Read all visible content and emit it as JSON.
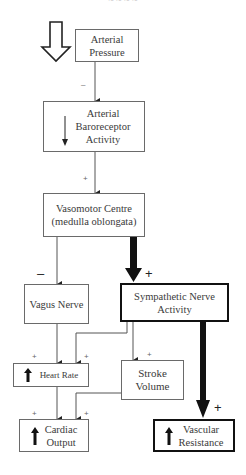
{
  "header": {
    "cutoff_text": "~ ~ ~ ~"
  },
  "nodes": {
    "arterial_pressure": {
      "label_line1": "Arterial",
      "label_line2": "Pressure"
    },
    "baroreceptor": {
      "label_line1": "Arterial",
      "label_line2": "Baroreceptor",
      "label_line3": "Activity",
      "indicator": "down-arrow"
    },
    "vasomotor": {
      "label_line1": "Vasomotor Centre",
      "label_line2": "(medulla oblongata)"
    },
    "vagus": {
      "label": "Vagus Nerve"
    },
    "sympathetic": {
      "label_line1": "Sympathetic Nerve",
      "label_line2": "Activity"
    },
    "heart_rate": {
      "label": "Heart Rate",
      "indicator": "up-arrow"
    },
    "stroke_volume": {
      "label_line1": "Stroke",
      "label_line2": "Volume"
    },
    "cardiac_output": {
      "label_line1": "Cardiac",
      "label_line2": "Output",
      "indicator": "up-arrow"
    },
    "vascular_resistance": {
      "label_line1": "Vascular",
      "label_line2": "Resistance",
      "indicator": "up-arrow"
    }
  },
  "signs": {
    "pressure_to_baro": "–",
    "baro_to_vasomotor": "+",
    "vasomotor_to_vagus": "–",
    "vasomotor_to_sympathetic": "+",
    "vagus_to_hr": "+",
    "symp_to_hr": "+",
    "symp_to_sv": "+",
    "hr_to_co": "+",
    "sv_to_co": "+",
    "symp_to_vr": "+"
  },
  "input_indicator": "hollow-down-arrow",
  "colors": {
    "line": "#555555",
    "thick": "#111111",
    "box_border": "#6a6a6a"
  }
}
